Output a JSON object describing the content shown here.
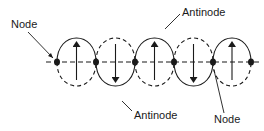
{
  "diagram": {
    "colors": {
      "stroke": "#1a1a1a",
      "background": "#ffffff"
    },
    "axis": {
      "y": 62,
      "x_start": 46,
      "x_end": 262,
      "style": "dashed"
    },
    "nodes": [
      {
        "x": 57
      },
      {
        "x": 96
      },
      {
        "x": 135
      },
      {
        "x": 174
      },
      {
        "x": 213
      },
      {
        "x": 251
      }
    ],
    "loops": [
      {
        "cx": 76.5,
        "direction": "up"
      },
      {
        "cx": 115.5,
        "direction": "down"
      },
      {
        "cx": 154.5,
        "direction": "up"
      },
      {
        "cx": 193.5,
        "direction": "down"
      },
      {
        "cx": 232,
        "direction": "up"
      }
    ],
    "loop_half_height": 37,
    "labels": {
      "node_left": "Node",
      "antinode_top": "Antinode",
      "antinode_bottom": "Antinode",
      "node_bottom": "Node"
    }
  }
}
